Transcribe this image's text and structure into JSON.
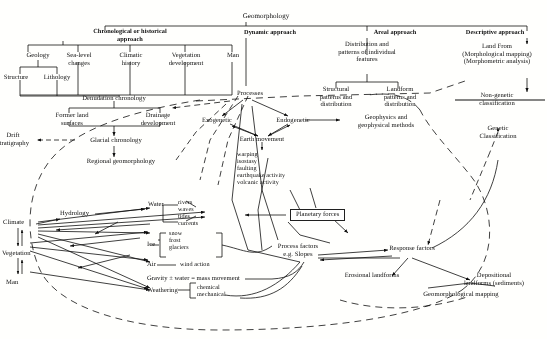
{
  "figure": {
    "title": "Geomorphology",
    "background_color": "#fdfdfb",
    "ink_color": "#111111"
  },
  "approaches": {
    "chronological": "Chronological or historical\napproach",
    "dynamic": "Dynamic approach",
    "areal": "Areal approach",
    "descriptive": "Descriptive approach"
  },
  "chronological_branch": {
    "nodes": [
      "Geology",
      "Sea-level\nchanges",
      "Climatic\nhistory",
      "Vegetation\ndevelopment",
      "Man"
    ],
    "geology_children": [
      "Structure",
      "Lithology"
    ],
    "denudation": "Denudation chronology",
    "denudation_children": [
      "Former land\nsurfaces",
      "Drainage\ndevelopment"
    ],
    "glacial": "Glacial chronology",
    "drift": "Drift\nstratigraphy",
    "regional": "Regional geomorphology"
  },
  "dynamic_branch": {
    "processes": "Processes",
    "exogenetic": "Exogenetic",
    "endogenetic": "Endogenetic",
    "earth_movement": "Earth movement",
    "earth_movement_list": "warping\nisostasy\nfaulting\nearthquake activity\nvolcanic activity",
    "geophysics": "Geophysics and\ngeophysical methods"
  },
  "areal_branch": {
    "heading": "Distribution and\npatterns of individual\nfeatures",
    "structural": "Structural\npatterns and\ndistribution",
    "landform": "Landform\npatterns and\ndistribution"
  },
  "descriptive_branch": {
    "landform": "Land From\n(Morphological mapping)\n(Morphometric analysis)",
    "non_genetic": "Non-genetic\nclassification"
  },
  "classification": {
    "genetic": "Genetic\nClassification"
  },
  "process_system": {
    "drivers": [
      "Climate",
      "Vegetation",
      "Man"
    ],
    "hydrology": "Hydrology",
    "planetary_forces": "Planetary forces",
    "agents": [
      {
        "name": "Water",
        "sub": "rivers\nwaves\ntides\ncurrents"
      },
      {
        "name": "Ice",
        "sub": "snow\nfrost\nglaciers"
      },
      {
        "name": "Air",
        "sub": "wind action"
      },
      {
        "name": "Gravity ± water = mass movement",
        "sub": ""
      },
      {
        "name": "Weathering",
        "sub": "chemical\nmechanical"
      }
    ]
  },
  "outputs": {
    "process_factors": "Process factors\ne.g. Slopes",
    "response_factors": "Response factors",
    "erosional": "Erosional landforms",
    "depositional": "Depositional\nlandforms (sediments)",
    "mapping": "Geomorphological mapping"
  }
}
